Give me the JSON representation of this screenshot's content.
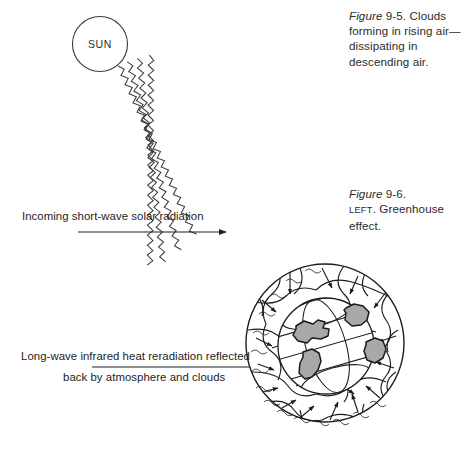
{
  "figure": {
    "sun_label": "SUN",
    "labels": {
      "incoming": "Incoming short-wave solar radiation",
      "longwave_line1": "Long-wave infrared heat reradiation reflected",
      "longwave_line2": "back by atmosphere and clouds"
    },
    "captions": {
      "clouds": {
        "ref": "Figure",
        "body": " 9-5. Clouds forming in rising air—dissipating in descending air."
      },
      "greenhouse": {
        "ref": "Figure",
        "number": " 9-6.",
        "position": "LEFT",
        "body": ". Greenhouse effect."
      }
    },
    "colors": {
      "ink": "#1d1d1d",
      "caption_text": "#2b2b2b",
      "land_fill": "#a8a8a8",
      "land_stroke": "#1a1a1a",
      "background": "#ffffff"
    }
  }
}
